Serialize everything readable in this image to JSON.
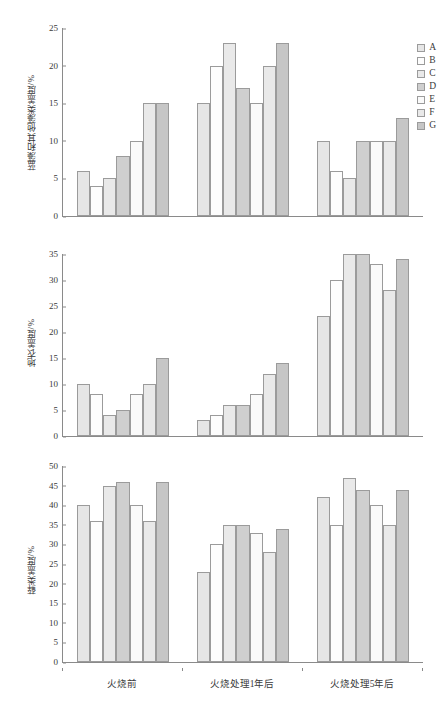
{
  "chart_data": [
    {
      "type": "bar",
      "title": "",
      "ylabel": "蓝藻和其他藻类盖度/%",
      "xlabel": "",
      "ylim": [
        0,
        25
      ],
      "yticks": [
        0,
        5,
        10,
        15,
        20,
        25
      ],
      "grid": false,
      "legend_position": "right",
      "categories": [
        "火烧前",
        "火烧处理1年后",
        "火烧处理5年后"
      ],
      "series": [
        {
          "name": "A",
          "values": [
            6,
            15,
            10
          ]
        },
        {
          "name": "B",
          "values": [
            4,
            20,
            6
          ]
        },
        {
          "name": "C",
          "values": [
            5,
            23,
            5
          ]
        },
        {
          "name": "D",
          "values": [
            8,
            17,
            10
          ]
        },
        {
          "name": "E",
          "values": [
            10,
            15,
            10
          ]
        },
        {
          "name": "F",
          "values": [
            15,
            20,
            10
          ]
        },
        {
          "name": "G",
          "values": [
            15,
            23,
            13
          ]
        }
      ]
    },
    {
      "type": "bar",
      "title": "",
      "ylabel": "地衣盖度/%",
      "xlabel": "",
      "ylim": [
        0,
        35
      ],
      "yticks": [
        0,
        5,
        10,
        15,
        20,
        25,
        30,
        35
      ],
      "grid": false,
      "legend_position": "none",
      "categories": [
        "火烧前",
        "火烧处理1年后",
        "火烧处理5年后"
      ],
      "series": [
        {
          "name": "A",
          "values": [
            10,
            3,
            23
          ]
        },
        {
          "name": "B",
          "values": [
            8,
            4,
            30
          ]
        },
        {
          "name": "C",
          "values": [
            4,
            6,
            35
          ]
        },
        {
          "name": "D",
          "values": [
            5,
            6,
            35
          ]
        },
        {
          "name": "E",
          "values": [
            8,
            8,
            33
          ]
        },
        {
          "name": "F",
          "values": [
            10,
            12,
            28
          ]
        },
        {
          "name": "G",
          "values": [
            15,
            14,
            34
          ]
        }
      ]
    },
    {
      "type": "bar",
      "title": "",
      "ylabel": "藓类盖度/%",
      "xlabel": "",
      "ylim": [
        0,
        50
      ],
      "yticks": [
        0,
        5,
        10,
        15,
        20,
        25,
        30,
        35,
        40,
        45,
        50
      ],
      "grid": false,
      "legend_position": "none",
      "categories": [
        "火烧前",
        "火烧处理1年后",
        "火烧处理5年后"
      ],
      "series": [
        {
          "name": "A",
          "values": [
            40,
            23,
            42
          ]
        },
        {
          "name": "B",
          "values": [
            36,
            30,
            35
          ]
        },
        {
          "name": "C",
          "values": [
            45,
            35,
            47
          ]
        },
        {
          "name": "D",
          "values": [
            46,
            35,
            44
          ]
        },
        {
          "name": "E",
          "values": [
            40,
            33,
            40
          ]
        },
        {
          "name": "F",
          "values": [
            36,
            28,
            35
          ]
        },
        {
          "name": "G",
          "values": [
            46,
            34,
            44
          ]
        }
      ]
    }
  ],
  "legend": {
    "items": [
      {
        "label": "A",
        "color": "#e6e6e6"
      },
      {
        "label": "B",
        "color": "#fdfdfd"
      },
      {
        "label": "C",
        "color": "#e9e9e9"
      },
      {
        "label": "D",
        "color": "#cfcfcf"
      },
      {
        "label": "E",
        "color": "#fafafa"
      },
      {
        "label": "F",
        "color": "#e9e9e9"
      },
      {
        "label": "G",
        "color": "#c6c6c6"
      }
    ]
  },
  "axis": {
    "x_categories": [
      "火烧前",
      "火烧处理1年后",
      "火烧处理5年后"
    ]
  },
  "panels": [
    {
      "ylabel": "蓝藻和其他藻类盖度/%"
    },
    {
      "ylabel": "地衣盖度/%"
    },
    {
      "ylabel": "藓类盖度/%"
    }
  ]
}
